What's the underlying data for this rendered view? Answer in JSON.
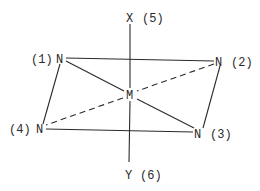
{
  "diagram": {
    "type": "octahedral-coordination",
    "center": {
      "symbol": "M"
    },
    "axial": {
      "top": {
        "symbol": "X",
        "index": "(5)"
      },
      "bottom": {
        "symbol": "Y",
        "index": "(6)"
      }
    },
    "equatorial": [
      {
        "symbol": "N",
        "index": "(1)"
      },
      {
        "symbol": "N",
        "index": "(2)"
      },
      {
        "symbol": "N",
        "index": "(3)"
      },
      {
        "symbol": "N",
        "index": "(4)"
      }
    ],
    "edges": {
      "solid": [
        "1-2",
        "2-3",
        "3-4",
        "4-1",
        "1-M",
        "M-3",
        "5-M",
        "M-6"
      ],
      "dashed": [
        "2-M",
        "M-4"
      ]
    }
  }
}
